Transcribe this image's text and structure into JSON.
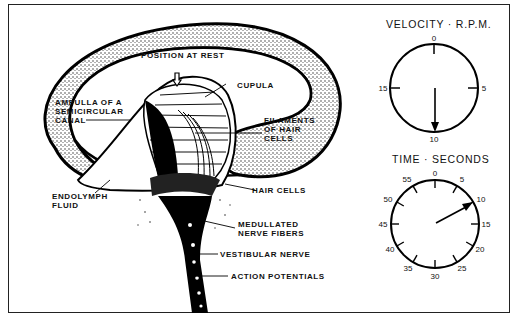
{
  "diagram": {
    "labels": {
      "position_at_rest": "POSITION AT REST",
      "cupula": "CUPULA",
      "ampulla": "AMPULLA OF A\nSEMICIRCULAR\nCANAL",
      "filaments": "FILAMENTS\nOF HAIR\nCELLS",
      "endolymph": "ENDOLYMPH\nFLUID",
      "hair_cells": "HAIR CELLS",
      "medullated": "MEDULLATED\nNERVE FIBERS",
      "vestibular_nerve": "VESTIBULAR NERVE",
      "action_potentials": "ACTION POTENTIALS"
    }
  },
  "velocity_dial": {
    "title": "VELOCITY · R.P.M.",
    "ticks": [
      "0",
      "5",
      "10",
      "15"
    ],
    "pointer_value": "10"
  },
  "time_dial": {
    "title": "TIME · SECONDS",
    "ticks": [
      "0",
      "5",
      "10",
      "15",
      "20",
      "25",
      "30",
      "35",
      "40",
      "45",
      "50",
      "55"
    ],
    "pointer_value": "10"
  }
}
